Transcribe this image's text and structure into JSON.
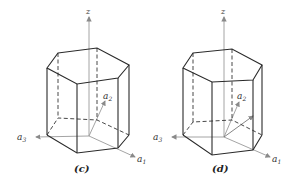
{
  "figures": [
    {
      "id": "c",
      "caption": "(c)",
      "axes": {
        "z": "z",
        "a1": "a",
        "a1_sub": "1",
        "a2": "a",
        "a2_sub": "2",
        "a3": "a",
        "a3_sub": "3"
      }
    },
    {
      "id": "d",
      "caption": "(d)",
      "axes": {
        "z": "z",
        "a1": "a",
        "a1_sub": "1",
        "a2": "a",
        "a2_sub": "2",
        "a3": "a",
        "a3_sub": "3"
      }
    }
  ],
  "colors": {
    "edge": "#2a2a2a",
    "axis": "#9a9a9a",
    "background": "#ffffff"
  }
}
